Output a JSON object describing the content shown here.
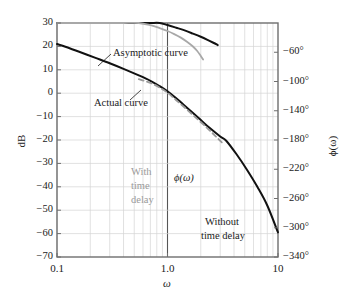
{
  "chart_data": {
    "type": "line",
    "title": "",
    "subtitle": "",
    "xlabel": "ω",
    "ylabel": "dB",
    "y2label": "ϕ(ω)",
    "xscale": "log",
    "xlim": [
      0.1,
      10
    ],
    "ylim": [
      -70,
      30
    ],
    "y2lim": [
      -340,
      -20
    ],
    "grid": true,
    "legend": "none",
    "xticks": [
      "0.1",
      "1.0",
      "10"
    ],
    "xtick_values": [
      0.1,
      1.0,
      10
    ],
    "yticks": [
      "30",
      "20",
      "10",
      "0",
      "−10",
      "−20",
      "−30",
      "−40",
      "−50",
      "−60",
      "−70"
    ],
    "ytick_values": [
      30,
      20,
      10,
      0,
      -10,
      -20,
      -30,
      -40,
      -50,
      -60,
      -70
    ],
    "y2ticks": [
      "−60°",
      "−100°",
      "−140°",
      "−180°",
      "−220°",
      "−260°",
      "−300°",
      "−340°"
    ],
    "y2tick_values": [
      -60,
      -100,
      -140,
      -180,
      -220,
      -260,
      -300,
      -340
    ],
    "emphasized_gridline_x": 1.0,
    "series": [
      {
        "name": "Asymptotic curve",
        "style": "solid",
        "color": "#111111",
        "width": 2.0,
        "axis": "left",
        "points": [
          [
            0.1,
            21.0
          ],
          [
            0.13,
            19.2
          ],
          [
            0.17,
            17.2
          ],
          [
            0.22,
            15.2
          ],
          [
            0.3,
            12.8
          ],
          [
            0.4,
            10.4
          ],
          [
            0.55,
            7.6
          ],
          [
            0.7,
            5.3
          ],
          [
            0.85,
            3.0
          ],
          [
            1.0,
            0.8
          ],
          [
            1.2,
            -2.2
          ],
          [
            1.5,
            -6.2
          ],
          [
            1.9,
            -10.5
          ],
          [
            2.4,
            -14.8
          ],
          [
            3.0,
            -18.5
          ],
          [
            3.4,
            -20.3
          ],
          [
            4.2,
            -26.0
          ],
          [
            5.2,
            -32.5
          ],
          [
            6.5,
            -40.0
          ],
          [
            8.0,
            -48.0
          ],
          [
            10.0,
            -59.5
          ]
        ]
      },
      {
        "name": "Actual curve",
        "style": "dashed",
        "color": "#9a9a9a",
        "width": 1.8,
        "axis": "left",
        "points": [
          [
            0.55,
            6.0
          ],
          [
            0.7,
            4.4
          ],
          [
            0.85,
            2.4
          ],
          [
            1.0,
            0.2
          ],
          [
            1.2,
            -3.0
          ],
          [
            1.5,
            -7.0
          ],
          [
            1.9,
            -11.4
          ],
          [
            2.3,
            -15.0
          ],
          [
            2.7,
            -18.2
          ],
          [
            3.1,
            -21.0
          ]
        ]
      },
      {
        "name": "Without time delay",
        "style": "solid",
        "color": "#111111",
        "width": 2.0,
        "axis": "right",
        "points": [
          [
            0.1,
            -5.0
          ],
          [
            0.13,
            -5.6
          ],
          [
            0.17,
            -6.5
          ],
          [
            0.22,
            -7.6
          ],
          [
            0.3,
            -9.2
          ],
          [
            0.4,
            -11.2
          ],
          [
            0.55,
            -14.0
          ],
          [
            0.7,
            -17.0
          ],
          [
            0.85,
            -20.0
          ],
          [
            1.0,
            -22.8
          ],
          [
            1.2,
            -26.5
          ],
          [
            1.45,
            -30.5
          ],
          [
            1.7,
            -34.5
          ],
          [
            2.0,
            -38.8
          ],
          [
            2.3,
            -43.0
          ],
          [
            2.6,
            -47.0
          ],
          [
            2.85,
            -50.2
          ]
        ]
      },
      {
        "name": "With time delay",
        "style": "solid",
        "color": "#a8a8a8",
        "width": 1.8,
        "axis": "right",
        "points": [
          [
            0.1,
            -6.8
          ],
          [
            0.13,
            -7.8
          ],
          [
            0.17,
            -9.0
          ],
          [
            0.22,
            -10.6
          ],
          [
            0.3,
            -12.8
          ],
          [
            0.4,
            -15.4
          ],
          [
            0.55,
            -19.2
          ],
          [
            0.7,
            -23.0
          ],
          [
            0.85,
            -27.0
          ],
          [
            1.0,
            -31.0
          ],
          [
            1.15,
            -35.2
          ],
          [
            1.32,
            -40.0
          ],
          [
            1.5,
            -45.5
          ],
          [
            1.68,
            -51.5
          ],
          [
            1.85,
            -58.0
          ],
          [
            2.0,
            -65.0
          ],
          [
            2.1,
            -70.0
          ]
        ]
      }
    ],
    "annotations": [
      {
        "id": "asymptotic-curve",
        "text": "Asymptotic curve",
        "color": "#1a1a1a",
        "leader": true
      },
      {
        "id": "actual-curve",
        "text": "Actual curve",
        "color": "#1a1a1a",
        "leader": true
      },
      {
        "id": "phi-omega",
        "text": "ϕ(ω)",
        "color": "#1a1a1a",
        "leader": false
      },
      {
        "id": "with-time-delay",
        "text": "With\ntime\ndelay",
        "color": "#9a9a9a",
        "leader": false
      },
      {
        "id": "without-time-delay",
        "text": "Without\ntime delay",
        "color": "#1a1a1a",
        "leader": false
      }
    ]
  },
  "axes": {
    "left_title": "dB",
    "right_title": "ϕ(ω)",
    "bottom_title": "ω"
  },
  "annotations": {
    "asymptotic": "Asymptotic curve",
    "actual": "Actual curve",
    "phi": "ϕ(ω)",
    "with_delay_l1": "With",
    "with_delay_l2": "time",
    "with_delay_l3": "delay",
    "without_delay_l1": "Without",
    "without_delay_l2": "time delay"
  },
  "colors": {
    "curve_black": "#111111",
    "curve_gray": "#a8a8a8",
    "grid": "#d4d4d4",
    "frame": "#6e6e6e",
    "emphasis_line": "#555555",
    "text": "#1a1a1a",
    "text_gray": "#9a9a9a",
    "background": "#ffffff"
  }
}
